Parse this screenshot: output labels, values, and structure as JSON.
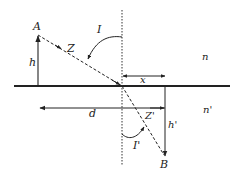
{
  "diagram": {
    "type": "refraction-apparent-depth",
    "colors": {
      "ink": "#222222",
      "background": "#ffffff"
    },
    "points": {
      "source": "A",
      "image": "B"
    },
    "labels": {
      "h": "h",
      "h_prime": "h'",
      "z": "Z",
      "z_prime": "Z'",
      "incidence_angle": "I",
      "refraction_angle": "I'",
      "x": "x",
      "d": "d",
      "n_upper": "n",
      "n_lower": "n'"
    },
    "media": [
      {
        "name": "upper-medium",
        "index_label": "n"
      },
      {
        "name": "lower-medium",
        "index_label": "n'"
      }
    ]
  }
}
